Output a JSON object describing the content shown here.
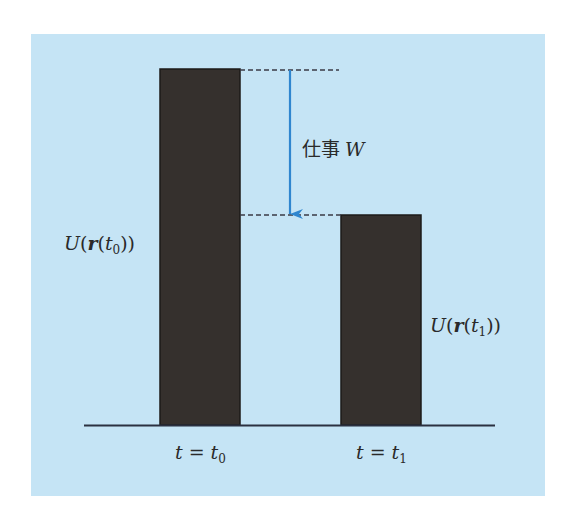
{
  "diagram": {
    "work_label": {
      "kanji": "仕事",
      "symbol": "W"
    },
    "bar_left": {
      "label": {
        "func": "U",
        "vec": "r",
        "var": "t",
        "sub": "0"
      },
      "time_label": {
        "lhs": "t",
        "eq": "=",
        "rhs": "t",
        "sub": "0"
      }
    },
    "bar_right": {
      "label": {
        "func": "U",
        "vec": "r",
        "var": "t",
        "sub": "1"
      },
      "time_label": {
        "lhs": "t",
        "eq": "=",
        "rhs": "t",
        "sub": "1"
      }
    },
    "colors": {
      "background": "#c5e4f5",
      "bar": "#35302d",
      "arrow": "#2f86cf",
      "line": "#2b3040"
    }
  }
}
